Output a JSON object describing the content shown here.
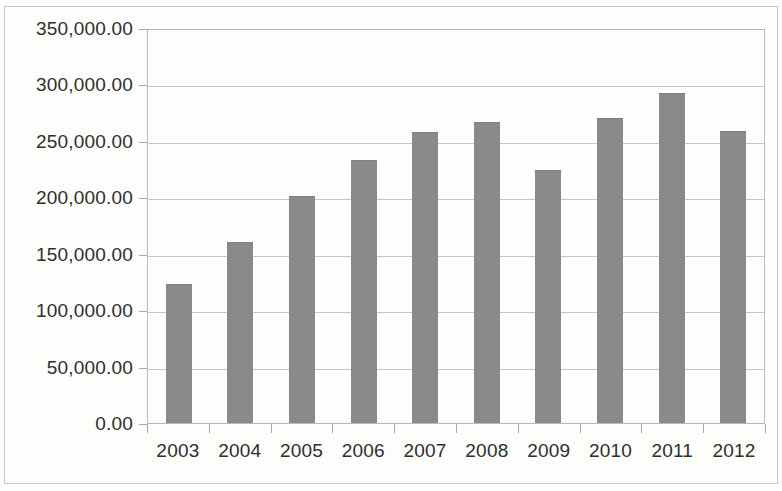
{
  "chart_data": {
    "type": "bar",
    "title": "",
    "subtitle": "",
    "xlabel": "",
    "ylabel": "",
    "categories": [
      "2003",
      "2004",
      "2005",
      "2006",
      "2007",
      "2008",
      "2009",
      "2010",
      "2011",
      "2012"
    ],
    "values": [
      123400,
      160600,
      201500,
      233200,
      257500,
      266500,
      224100,
      270500,
      292500,
      258500
    ],
    "series": [
      {
        "name": "",
        "values": [
          123400,
          160600,
          201500,
          233200,
          257500,
          266500,
          224100,
          270500,
          292500,
          258500
        ]
      }
    ],
    "ylim": [
      0,
      350000
    ],
    "y_ticks": [
      0,
      50000,
      100000,
      150000,
      200000,
      250000,
      300000,
      350000
    ],
    "y_tick_labels": [
      "0.00",
      "50,000.00",
      "100,000.00",
      "150,000.00",
      "200,000.00",
      "250,000.00",
      "300,000.00",
      "350,000.00"
    ],
    "grid": true,
    "grid_axis": "y",
    "legend": false,
    "legend_position": "none",
    "bar_color": "#8a8a8a",
    "grid_color": "#c6c6c2",
    "axis_color": "#a8a8a4",
    "background_color": "#fdfdfc",
    "text_color": "#2e2e2e"
  }
}
